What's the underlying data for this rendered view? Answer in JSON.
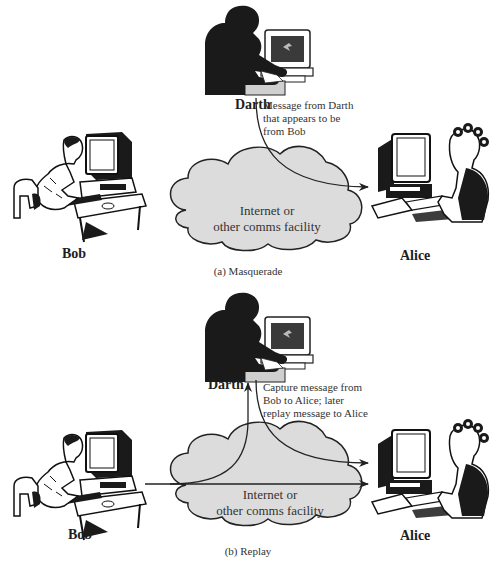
{
  "figure": {
    "panels": [
      {
        "id": "a",
        "caption": "(a) Masquerade",
        "actors": {
          "attacker": "Darth",
          "sender": "Bob",
          "receiver": "Alice"
        },
        "network_label_line1": "Internet or",
        "network_label_line2": "other comms facility",
        "annotation": [
          "Message from Darth",
          "that appears to be",
          "from Bob"
        ],
        "flows": [
          {
            "from": "Darth",
            "to": "Alice",
            "description": "Message from Darth that appears to be from Bob"
          }
        ]
      },
      {
        "id": "b",
        "caption": "(b) Replay",
        "actors": {
          "attacker": "Darth",
          "sender": "Bob",
          "receiver": "Alice"
        },
        "network_label_line1": "Internet or",
        "network_label_line2": "other comms facility",
        "annotation": [
          "Capture message from",
          "Bob to Alice; later",
          "replay message to Alice"
        ],
        "flows": [
          {
            "from": "Bob",
            "to": "Alice",
            "description": "Original message"
          },
          {
            "from": "Bob",
            "to": "Darth",
            "description": "Captured message"
          },
          {
            "from": "Darth",
            "to": "Alice",
            "description": "Replayed message"
          }
        ]
      }
    ],
    "colors": {
      "cloud_fill": "#dcdcdc",
      "line": "#222222",
      "silhouette": "#1a1a1a",
      "background": "#ffffff"
    }
  }
}
